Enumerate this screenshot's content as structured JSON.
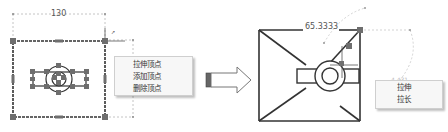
{
  "left_figure": {
    "dimension_label": "130",
    "context_menu": {
      "items": [
        {
          "label": "拉伸顶点"
        },
        {
          "label": "添加顶点"
        },
        {
          "label": "删除顶点"
        }
      ]
    }
  },
  "transition": {
    "icon": "right-arrow-icon"
  },
  "right_figure": {
    "dimension_label": "65.3333",
    "context_menu": {
      "items": [
        {
          "label": "拉伸"
        },
        {
          "label": "拉长"
        }
      ]
    }
  },
  "colors": {
    "line": "#333333",
    "grip": "#6e6e6e",
    "dim_line": "#b5b5b5",
    "menu_bg": "#f7f7f7"
  }
}
